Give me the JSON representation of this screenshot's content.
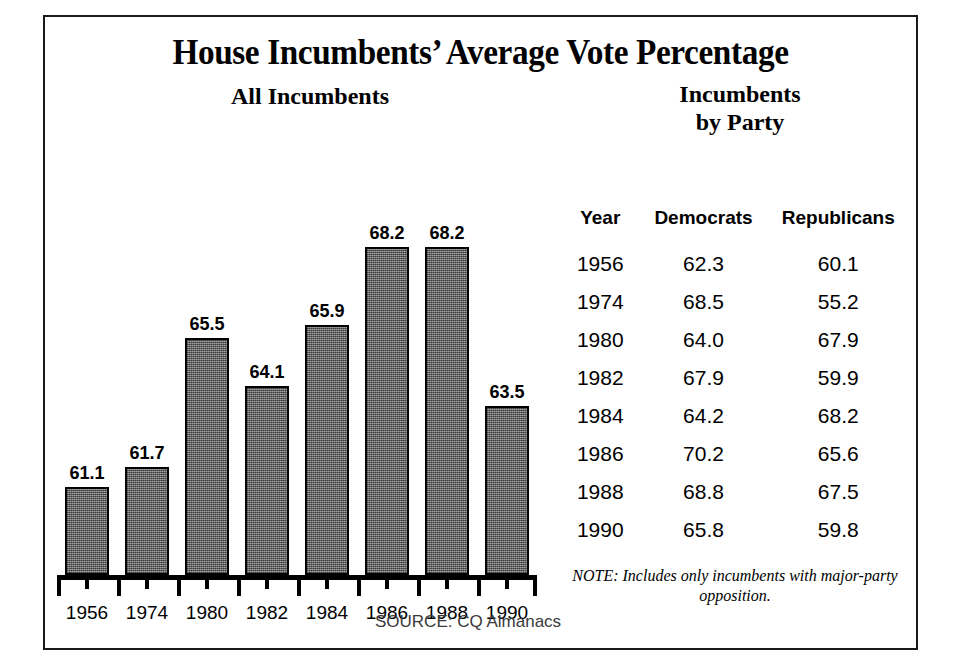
{
  "figure": {
    "title": "House Incumbents’ Average Vote Percentage",
    "left_subtitle": "All Incumbents",
    "right_subtitle_line1": "Incumbents",
    "right_subtitle_line2": "by Party",
    "source": "SOURCE: CQ Almanacs",
    "note_line1": "NOTE: Includes only incumbents with",
    "note_line2": "major-party opposition.",
    "border_color": "#1a1a1a",
    "bar_fill_color": "#6f6f6f",
    "bar_outline_color": "#000000"
  },
  "chart_data": {
    "type": "bar",
    "title": "House Incumbents’ Average Vote Percentage",
    "subtitle": "All Incumbents",
    "xlabel": "",
    "ylabel": "",
    "categories": [
      "1956",
      "1974",
      "1980",
      "1982",
      "1984",
      "1986",
      "1988",
      "1990"
    ],
    "values": [
      61.1,
      61.7,
      65.5,
      64.1,
      65.9,
      68.2,
      68.2,
      63.5
    ],
    "value_labels": [
      "61.1",
      "61.7",
      "65.5",
      "64.1",
      "65.9",
      "68.2",
      "68.2",
      "63.5"
    ],
    "ylim": [
      58.5,
      69.5
    ],
    "grid": false,
    "legend": "none",
    "note": "NOTE: Includes only incumbents with major-party opposition.",
    "source": "SOURCE: CQ Almanacs"
  },
  "party_table": {
    "heading_line1": "Incumbents",
    "heading_line2": "by Party",
    "columns": [
      "Year",
      "Democrats",
      "Republicans"
    ],
    "rows": [
      {
        "year": "1956",
        "democrats": "62.3",
        "republicans": "60.1"
      },
      {
        "year": "1974",
        "democrats": "68.5",
        "republicans": "55.2"
      },
      {
        "year": "1980",
        "democrats": "64.0",
        "republicans": "67.9"
      },
      {
        "year": "1982",
        "democrats": "67.9",
        "republicans": "59.9"
      },
      {
        "year": "1984",
        "democrats": "64.2",
        "republicans": "68.2"
      },
      {
        "year": "1986",
        "democrats": "70.2",
        "republicans": "65.6"
      },
      {
        "year": "1988",
        "democrats": "68.8",
        "republicans": "67.5"
      },
      {
        "year": "1990",
        "democrats": "65.8",
        "republicans": "59.8"
      }
    ]
  }
}
